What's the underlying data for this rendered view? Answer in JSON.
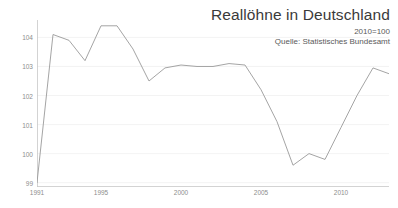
{
  "header": {
    "title": "Reallöhne in Deutschland",
    "subtitle": "2010=100",
    "source": "Quelle: Statistisches Bundesamt"
  },
  "chart_data": {
    "type": "line",
    "title": "Reallöhne in Deutschland",
    "subtitle": "2010=100",
    "source": "Quelle: Statistisches Bundesamt",
    "xlabel": "",
    "ylabel": "",
    "xlim": [
      1991,
      2014
    ],
    "ylim": [
      98.85,
      104.6
    ],
    "grid": true,
    "grid_axis": "y",
    "legend": false,
    "legend_position": "none",
    "line_color": "#9a9a9a",
    "grid_color": "#f0f0f0",
    "axis_color": "#c8c8c8",
    "tick_label_color": "#8d8d8d",
    "y_ticks": [
      104,
      103,
      102,
      101,
      100,
      99
    ],
    "y_tick_labels": [
      "104",
      "103",
      "102",
      "101",
      "100",
      "99"
    ],
    "x_ticks": [
      1991,
      1995,
      2000,
      2005,
      2010
    ],
    "x_tick_labels": [
      "1991",
      "1995",
      "2000",
      "2005",
      "2010"
    ],
    "x": [
      1991,
      1992,
      1993,
      1994,
      1995,
      1996,
      1997,
      1998,
      1999,
      2000,
      2001,
      2002,
      2003,
      2004,
      2005,
      2006,
      2007,
      2008,
      2009,
      2010,
      2011,
      2012,
      2013,
      2014
    ],
    "series": [
      {
        "name": "Reallöhne",
        "values": [
          99.0,
          104.1,
          103.9,
          103.2,
          104.4,
          104.4,
          103.6,
          102.5,
          102.95,
          103.05,
          103.0,
          103.0,
          103.1,
          103.05,
          102.2,
          101.1,
          99.6,
          100.0,
          99.8,
          100.9,
          102.0,
          102.95,
          102.75,
          102.9
        ]
      }
    ]
  }
}
